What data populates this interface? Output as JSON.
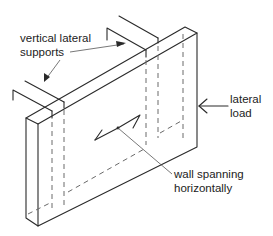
{
  "figure": {
    "labels": {
      "supports_line1": "vertical lateral",
      "supports_line2": "supports",
      "load_line1": "lateral",
      "load_line2": "load",
      "span_line1": "wall spanning",
      "span_line2": "horizontally"
    },
    "colors": {
      "line": "#2a2a2a",
      "hidden_line": "#6a6a6a",
      "background": "#ffffff"
    }
  }
}
